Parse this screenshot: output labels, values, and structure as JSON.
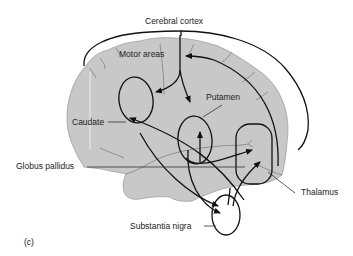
{
  "figure": {
    "panel_label": "(c)",
    "labels": {
      "cerebral_cortex": "Cerebral cortex",
      "motor_areas": "Motor areas",
      "putamen": "Putamen",
      "caudate": "Caudate",
      "globus_pallidus": "Globus pallidus",
      "thalamus": "Thalamus",
      "substantia_nigra": "Substantia nigra"
    },
    "colors": {
      "brain_fill": "#c8c8c8",
      "line": "#111111"
    }
  }
}
